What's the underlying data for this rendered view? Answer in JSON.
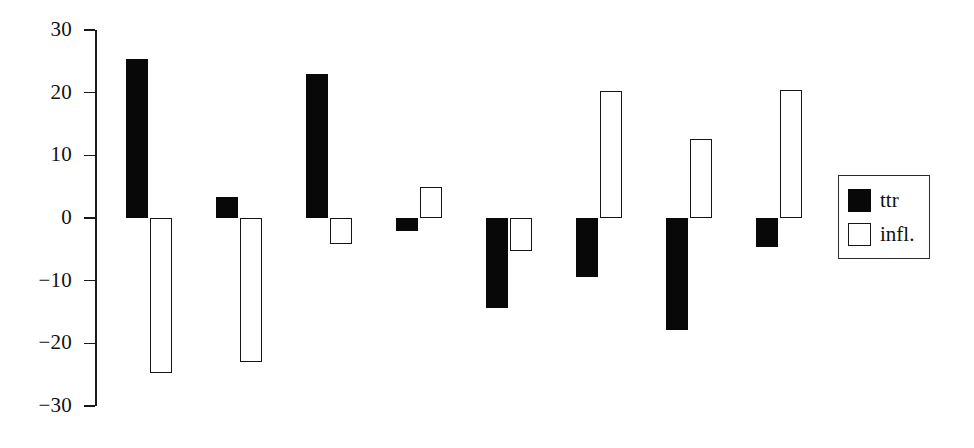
{
  "chart_data": {
    "type": "bar",
    "title": "",
    "xlabel": "",
    "ylabel": "",
    "ylim": [
      -30,
      30
    ],
    "yticks": [
      30,
      20,
      10,
      0,
      -10,
      -20,
      -30
    ],
    "ytick_labels": [
      "30",
      "20",
      "10",
      "0",
      "−10",
      "−20",
      "−30"
    ],
    "grid": false,
    "legend_position": "right",
    "categories": [
      "1",
      "2",
      "3",
      "4",
      "5",
      "6",
      "7",
      "8"
    ],
    "series": [
      {
        "name": "ttr",
        "style": "filled-black",
        "color": "#080808",
        "values": [
          25.3,
          3.4,
          22.9,
          -2.0,
          -14.3,
          -9.4,
          -17.9,
          -4.6
        ]
      },
      {
        "name": "infl.",
        "style": "open-white",
        "color": "#ffffff",
        "edge_color": "#151515",
        "values": [
          -24.7,
          -22.9,
          -4.2,
          5.0,
          -5.3,
          20.3,
          12.6,
          20.5
        ]
      }
    ]
  },
  "legend": {
    "entries": [
      {
        "label": "ttr",
        "swatch": "filled"
      },
      {
        "label": "infl.",
        "swatch": "open"
      }
    ]
  },
  "colors": {
    "background": "#ffffff",
    "axis": "#1a1a1a",
    "series_ttr": "#080808",
    "series_infl_fill": "#ffffff",
    "series_infl_edge": "#151515"
  }
}
